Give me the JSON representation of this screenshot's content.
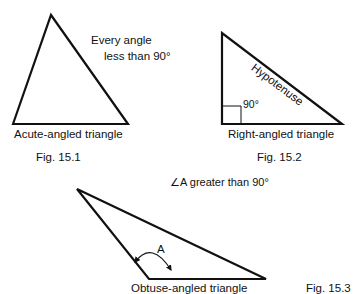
{
  "figures": [
    {
      "id": "15.1",
      "caption": "Fig. 15.1",
      "title": "Acute-angled triangle",
      "annotation_line1": "Every angle",
      "annotation_line2": "less than 90°"
    },
    {
      "id": "15.2",
      "caption": "Fig. 15.2",
      "title": "Right-angled triangle",
      "side_label": "Hypotenuse",
      "angle_label": "90°"
    },
    {
      "id": "15.3",
      "caption": "Fig. 15.3",
      "title": "Obtuse-angled triangle",
      "annotation": "∠A greater than 90°",
      "angle_label": "A"
    }
  ],
  "colors": {
    "stroke": "#111111",
    "background": "#ffffff"
  }
}
